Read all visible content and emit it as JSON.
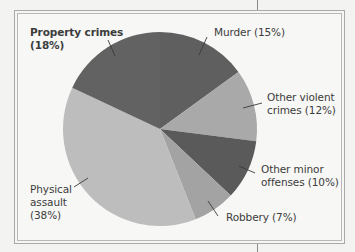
{
  "chart_data": {
    "type": "pie",
    "title": "",
    "start_angle_deg": 0,
    "direction": "clockwise",
    "categories": [
      "Murder",
      "Other violent crimes",
      "Other minor offenses",
      "Robbery",
      "Physical assault",
      "Property crimes"
    ],
    "values": [
      15,
      12,
      10,
      7,
      38,
      18
    ],
    "unit": "%",
    "colors": [
      "#5f5f5f",
      "#a9a9a9",
      "#5a5a5a",
      "#a3a3a3",
      "#bdbdbd",
      "#626262"
    ],
    "labels": [
      {
        "line1": "Murder",
        "pct": "(15%)"
      },
      {
        "line1": "Other violent",
        "line2": "crimes",
        "pct": "(12%)"
      },
      {
        "line1": "Other minor",
        "line2": "offenses",
        "pct": "(10%)"
      },
      {
        "line1": "Robbery",
        "pct": "(7%)"
      },
      {
        "line1": "Physical",
        "line2": "assault",
        "pct": "(38%)"
      },
      {
        "line1": "Property crimes",
        "pct": "(18%)"
      }
    ]
  },
  "labels": {
    "murder": "Murder (15%)",
    "other_violent": "Other violent\ncrimes (12%)",
    "other_minor": "Other minor\noffenses (10%)",
    "robbery": "Robbery (7%)",
    "physical_assault": "Physical\nassault\n(38%)",
    "property_crimes": "Property crimes\n(18%)"
  }
}
